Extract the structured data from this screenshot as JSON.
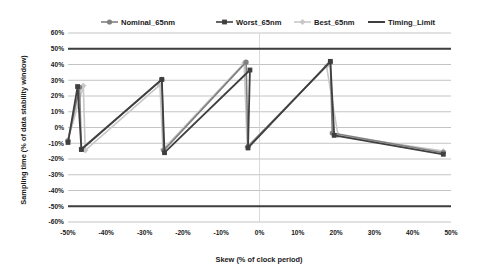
{
  "chart_data": {
    "type": "line",
    "title": "",
    "xlabel": "Skew (% of clock period)",
    "ylabel": "Sampling time (% of  data stability window)",
    "xlim": [
      -50,
      50
    ],
    "ylim": [
      -60,
      60
    ],
    "xticks": [
      -50,
      -40,
      -30,
      -20,
      -10,
      0,
      10,
      20,
      30,
      40,
      50
    ],
    "xticklabels": [
      "-50%",
      "-40%",
      "-30%",
      "-20%",
      "-10%",
      "0%",
      "10%",
      "20%",
      "30%",
      "40%",
      "50%"
    ],
    "yticks": [
      60,
      50,
      40,
      30,
      20,
      10,
      0,
      -10,
      -20,
      -30,
      -40,
      -50,
      -60
    ],
    "yticklabels": [
      "60%",
      "50%",
      "40%",
      "30%",
      "20%",
      "10%",
      "0%",
      "-10%",
      "-20%",
      "-30%",
      "-40%",
      "-50%",
      "-60%"
    ],
    "grid": true,
    "legend_position": "top",
    "series": [
      {
        "name": "Nominal_65nm",
        "color": "#808080",
        "marker": "circle",
        "line_width": 1.6,
        "points": [
          [
            -50,
            -8.5
          ],
          [
            -47,
            25.5
          ],
          [
            -46.5,
            -13.5
          ],
          [
            -25.5,
            30.5
          ],
          [
            -25,
            -14.5
          ],
          [
            -3.5,
            41.5
          ],
          [
            -3.0,
            -12.0
          ],
          [
            18.5,
            41.5
          ],
          [
            19.0,
            -3.5
          ],
          [
            48,
            -16.0
          ]
        ]
      },
      {
        "name": "Worst_65nm",
        "color": "#3f3f3f",
        "marker": "square",
        "line_width": 1.8,
        "points": [
          [
            -50,
            -9.5
          ],
          [
            -47.5,
            26.0
          ],
          [
            -46.5,
            -14.0
          ],
          [
            -25.5,
            30.5
          ],
          [
            -24.8,
            -16.0
          ],
          [
            -2.5,
            36.5
          ],
          [
            -3.0,
            -13.0
          ],
          [
            18.5,
            42.0
          ],
          [
            19.5,
            -5.0
          ],
          [
            48,
            -17.0
          ]
        ]
      },
      {
        "name": "Best_65nm",
        "color": "#c8c8c8",
        "marker": "diamond",
        "line_width": 1.6,
        "points": [
          [
            -50,
            -8.0
          ],
          [
            -46.0,
            26.5
          ],
          [
            -45.5,
            -14.5
          ],
          [
            -26.0,
            27.0
          ],
          [
            -25.2,
            -14.0
          ],
          [
            -4.0,
            41.0
          ],
          [
            -3.2,
            -12.5
          ],
          [
            17.5,
            39.0
          ],
          [
            20.5,
            -5.0
          ],
          [
            48,
            -15.0
          ]
        ]
      },
      {
        "name": "Timing_Limit",
        "color": "#3f3f3f",
        "marker": "none",
        "line_width": 2.0,
        "points": [
          [
            -50,
            50
          ],
          [
            50,
            50
          ]
        ],
        "second_line": [
          [
            -50,
            -50
          ],
          [
            50,
            -50
          ]
        ]
      }
    ]
  },
  "legend": {
    "items": [
      {
        "label": "Nominal_65nm",
        "color": "#808080",
        "marker": "circle"
      },
      {
        "label": "Worst_65nm",
        "color": "#3f3f3f",
        "marker": "square"
      },
      {
        "label": "Best_65nm",
        "color": "#c8c8c8",
        "marker": "diamond"
      },
      {
        "label": "Timing_Limit",
        "color": "#3f3f3f",
        "marker": "none"
      }
    ]
  },
  "style": {
    "background": "#ffffff",
    "gridline_color": "#b5b5b5",
    "zero_vline_color": "#d0d0d0",
    "text_color": "#1a1a1a"
  }
}
